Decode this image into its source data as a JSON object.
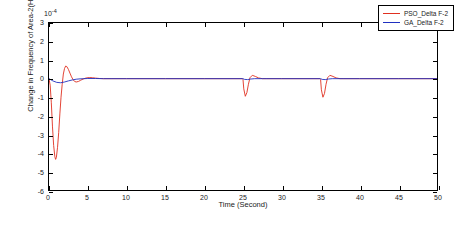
{
  "chart_data": {
    "type": "line",
    "title": "",
    "xlabel": "Time (Second)",
    "ylabel": "Change in Frequency of Area-2(Hz)",
    "y_exponent": "10",
    "y_exponent_power": "-4",
    "xlim": [
      0,
      50
    ],
    "ylim": [
      -6,
      3
    ],
    "xticks": [
      0,
      5,
      10,
      15,
      20,
      25,
      30,
      35,
      40,
      45,
      50
    ],
    "xticklabels": [
      "0",
      "5",
      "10",
      "15",
      "20",
      "25",
      "30",
      "35",
      "40",
      "45",
      "50"
    ],
    "yticks": [
      -6,
      -5,
      -4,
      -3,
      -2,
      -1,
      0,
      1,
      2,
      3
    ],
    "yticklabels": [
      "-6",
      "-5",
      "-4",
      "-3",
      "-2",
      "-1",
      "0",
      "1",
      "2",
      "3"
    ],
    "grid": false,
    "legend_position": "top-right",
    "series": [
      {
        "name": "PSO_Delta F-2",
        "color": "#e03020",
        "points": [
          [
            0.0,
            0.0
          ],
          [
            0.15,
            -0.35
          ],
          [
            0.3,
            -1.3
          ],
          [
            0.45,
            -2.6
          ],
          [
            0.6,
            -3.6
          ],
          [
            0.75,
            -4.2
          ],
          [
            0.85,
            -4.35
          ],
          [
            0.95,
            -4.25
          ],
          [
            1.1,
            -3.7
          ],
          [
            1.25,
            -2.9
          ],
          [
            1.4,
            -1.9
          ],
          [
            1.55,
            -1.0
          ],
          [
            1.7,
            -0.3
          ],
          [
            1.85,
            0.25
          ],
          [
            2.0,
            0.55
          ],
          [
            2.15,
            0.68
          ],
          [
            2.3,
            0.65
          ],
          [
            2.5,
            0.5
          ],
          [
            2.7,
            0.3
          ],
          [
            2.9,
            0.1
          ],
          [
            3.1,
            -0.05
          ],
          [
            3.3,
            -0.15
          ],
          [
            3.5,
            -0.18
          ],
          [
            3.8,
            -0.15
          ],
          [
            4.1,
            -0.08
          ],
          [
            4.4,
            -0.02
          ],
          [
            4.8,
            0.04
          ],
          [
            5.2,
            0.06
          ],
          [
            5.6,
            0.05
          ],
          [
            6.0,
            0.03
          ],
          [
            6.5,
            0.01
          ],
          [
            7.0,
            0.0
          ],
          [
            8.0,
            0.0
          ],
          [
            10.0,
            0.0
          ],
          [
            15.0,
            0.0
          ],
          [
            20.0,
            0.0
          ],
          [
            24.9,
            0.0
          ],
          [
            25.0,
            -0.05
          ],
          [
            25.1,
            -0.55
          ],
          [
            25.3,
            -0.95
          ],
          [
            25.5,
            -0.75
          ],
          [
            25.7,
            -0.3
          ],
          [
            25.9,
            0.05
          ],
          [
            26.2,
            0.18
          ],
          [
            26.6,
            0.12
          ],
          [
            27.0,
            0.04
          ],
          [
            27.5,
            0.0
          ],
          [
            28.0,
            0.0
          ],
          [
            30.0,
            0.0
          ],
          [
            34.9,
            0.0
          ],
          [
            35.0,
            -0.05
          ],
          [
            35.1,
            -0.6
          ],
          [
            35.3,
            -1.0
          ],
          [
            35.5,
            -0.8
          ],
          [
            35.7,
            -0.3
          ],
          [
            35.9,
            0.05
          ],
          [
            36.2,
            0.18
          ],
          [
            36.6,
            0.12
          ],
          [
            37.0,
            0.04
          ],
          [
            37.5,
            0.0
          ],
          [
            38.0,
            0.0
          ],
          [
            40.0,
            0.0
          ],
          [
            45.0,
            0.0
          ],
          [
            50.0,
            0.0
          ]
        ]
      },
      {
        "name": "GA_Delta F-2",
        "color": "#2030c0",
        "points": [
          [
            0.0,
            0.0
          ],
          [
            0.2,
            -0.05
          ],
          [
            0.5,
            -0.12
          ],
          [
            1.0,
            -0.2
          ],
          [
            1.5,
            -0.22
          ],
          [
            2.0,
            -0.18
          ],
          [
            2.5,
            -0.12
          ],
          [
            3.0,
            -0.07
          ],
          [
            3.5,
            -0.03
          ],
          [
            4.0,
            -0.01
          ],
          [
            4.5,
            0.0
          ],
          [
            5.0,
            0.01
          ],
          [
            6.0,
            0.01
          ],
          [
            7.0,
            0.0
          ],
          [
            10.0,
            0.0
          ],
          [
            15.0,
            0.0
          ],
          [
            20.0,
            0.0
          ],
          [
            25.0,
            0.0
          ],
          [
            25.2,
            -0.04
          ],
          [
            25.6,
            -0.05
          ],
          [
            26.0,
            -0.02
          ],
          [
            26.5,
            0.0
          ],
          [
            30.0,
            0.0
          ],
          [
            35.0,
            0.0
          ],
          [
            35.2,
            -0.04
          ],
          [
            35.6,
            -0.05
          ],
          [
            36.0,
            -0.02
          ],
          [
            36.5,
            0.0
          ],
          [
            40.0,
            0.0
          ],
          [
            45.0,
            0.0
          ],
          [
            50.0,
            0.0
          ]
        ]
      }
    ],
    "legend": [
      {
        "label": "PSO_Delta F-2",
        "color": "#e03020"
      },
      {
        "label": "GA_Delta F-2",
        "color": "#2030c0"
      }
    ]
  }
}
